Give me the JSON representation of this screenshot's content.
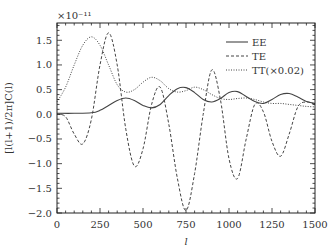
{
  "chart_data": {
    "type": "line",
    "title": "",
    "xlabel": "l",
    "ylabel": "[l(l+1)/2π]C(l)",
    "y_scale_note": "×10⁻¹¹",
    "xlim": [
      0,
      1500
    ],
    "ylim": [
      -2.0,
      1.85
    ],
    "xticks": [
      0,
      250,
      500,
      750,
      1000,
      1250,
      1500
    ],
    "xtick_labels": [
      "0",
      "250",
      "500",
      "750",
      "1000",
      "1250",
      "1500"
    ],
    "yticks": [
      -2.0,
      -1.5,
      -1.0,
      -0.5,
      0.0,
      0.5,
      1.0,
      1.5
    ],
    "ytick_labels": [
      "−2.0",
      "−1.5",
      "−1.0",
      "−0.5",
      "0.0",
      "0.5",
      "1.0",
      "1.5"
    ],
    "grid": false,
    "legend_position": "upper right",
    "series": [
      {
        "name": "EE",
        "style": "solid",
        "x": [
          0,
          100,
          200,
          250,
          300,
          350,
          400,
          450,
          500,
          550,
          600,
          650,
          700,
          750,
          800,
          850,
          900,
          950,
          1000,
          1050,
          1100,
          1150,
          1200,
          1250,
          1300,
          1350,
          1400,
          1450,
          1500
        ],
        "y": [
          0.02,
          0.02,
          0.03,
          0.08,
          0.18,
          0.28,
          0.33,
          0.28,
          0.18,
          0.13,
          0.2,
          0.38,
          0.52,
          0.54,
          0.44,
          0.3,
          0.25,
          0.32,
          0.44,
          0.46,
          0.36,
          0.26,
          0.22,
          0.3,
          0.4,
          0.42,
          0.35,
          0.26,
          0.22
        ]
      },
      {
        "name": "TE",
        "style": "dashed",
        "x": [
          0,
          50,
          100,
          150,
          200,
          250,
          300,
          350,
          400,
          450,
          500,
          550,
          600,
          650,
          700,
          750,
          800,
          850,
          900,
          950,
          1000,
          1050,
          1100,
          1150,
          1200,
          1250,
          1300,
          1350,
          1400,
          1450,
          1500
        ],
        "y": [
          0.0,
          -0.05,
          -0.4,
          -0.6,
          -0.1,
          1.0,
          1.65,
          1.0,
          -0.3,
          -1.05,
          -0.7,
          0.2,
          0.55,
          -0.2,
          -1.3,
          -1.95,
          -1.2,
          0.0,
          0.9,
          0.3,
          -0.9,
          -1.3,
          -0.5,
          0.2,
          0.05,
          -0.55,
          -0.85,
          -0.4,
          0.15,
          0.25,
          0.2
        ]
      },
      {
        "name": "TT(×0.02)",
        "style": "dotted",
        "x": [
          0,
          50,
          100,
          150,
          200,
          250,
          300,
          350,
          400,
          450,
          500,
          550,
          600,
          650,
          700,
          750,
          800,
          850,
          900,
          950,
          1000,
          1050,
          1100,
          1150,
          1200,
          1250,
          1300,
          1350,
          1400,
          1450,
          1500
        ],
        "y": [
          0.25,
          0.55,
          1.0,
          1.4,
          1.57,
          1.4,
          1.0,
          0.6,
          0.45,
          0.5,
          0.65,
          0.75,
          0.68,
          0.52,
          0.45,
          0.48,
          0.55,
          0.5,
          0.4,
          0.32,
          0.3,
          0.32,
          0.33,
          0.3,
          0.25,
          0.22,
          0.22,
          0.2,
          0.18,
          0.16,
          0.15
        ]
      }
    ]
  },
  "legend": {
    "items": [
      {
        "label": "EE",
        "style": "solid"
      },
      {
        "label": "TE",
        "style": "dashed"
      },
      {
        "label": "TT(×0.02)",
        "style": "dotted"
      }
    ]
  },
  "colors": {
    "line": "#444444",
    "axis": "#222222",
    "text": "#333333"
  }
}
